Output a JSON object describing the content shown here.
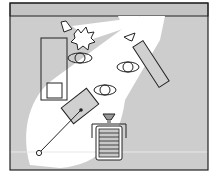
{
  "diagram": {
    "type": "studio-lighting-setup",
    "colors": {
      "background": "#ffffff",
      "floor": "#cfcfcf",
      "wall": "#c6c6c6",
      "light_spill": "#ffffff",
      "stroke": "#222222",
      "panel_fill": "#d0d0d0"
    },
    "elements": [
      {
        "id": "backdrop-wall",
        "label": ""
      },
      {
        "id": "key-light-softbox",
        "label": ""
      },
      {
        "id": "light-stand-handle",
        "label": ""
      },
      {
        "id": "camera-on-tripod",
        "label": ""
      },
      {
        "id": "background-light",
        "label": ""
      },
      {
        "id": "tree-prop",
        "label": ""
      },
      {
        "id": "rim-light",
        "label": ""
      },
      {
        "id": "reflector-panel",
        "label": ""
      },
      {
        "id": "table-prop",
        "label": ""
      },
      {
        "id": "stool",
        "label": ""
      },
      {
        "id": "subject-1",
        "label": ""
      },
      {
        "id": "subject-2",
        "label": ""
      },
      {
        "id": "subject-3",
        "label": ""
      }
    ]
  }
}
